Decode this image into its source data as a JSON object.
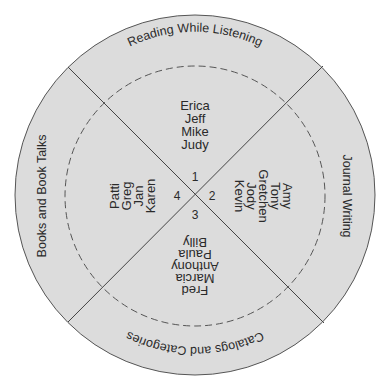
{
  "diagram": {
    "type": "circular-group-rotation",
    "colors": {
      "fill": "#dcdcdc",
      "stroke": "#555555",
      "text": "#2a2a2a",
      "background": "#ffffff"
    },
    "stations": {
      "top": "Reading While Listening",
      "right": "Journal Writing",
      "bottom": "Catalogs and Categories",
      "left": "Books and Book Talks"
    },
    "group_numbers": {
      "top": "1",
      "right": "2",
      "bottom": "3",
      "left": "4"
    },
    "groups": {
      "top": [
        "Erica",
        "Jeff",
        "Mike",
        "Judy"
      ],
      "right": [
        "Amy",
        "Tony",
        "Gretchen",
        "Jody",
        "Kevin"
      ],
      "bottom": [
        "Fred",
        "Marcia",
        "Anthony",
        "Paula",
        "Billy"
      ],
      "left": [
        "Patti",
        "Greg",
        "Jan",
        "Karen"
      ]
    }
  }
}
